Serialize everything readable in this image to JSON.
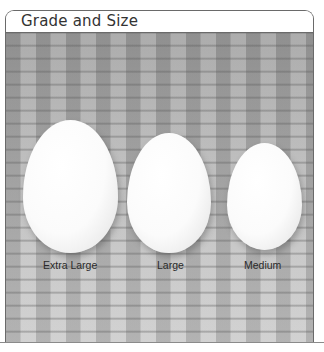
{
  "panel": {
    "title": "Grade and Size"
  },
  "photo": {
    "description": "Three white eggs on a woven basket background",
    "eggs": [
      {
        "label": "Extra Large"
      },
      {
        "label": "Large"
      },
      {
        "label": "Medium"
      }
    ]
  }
}
